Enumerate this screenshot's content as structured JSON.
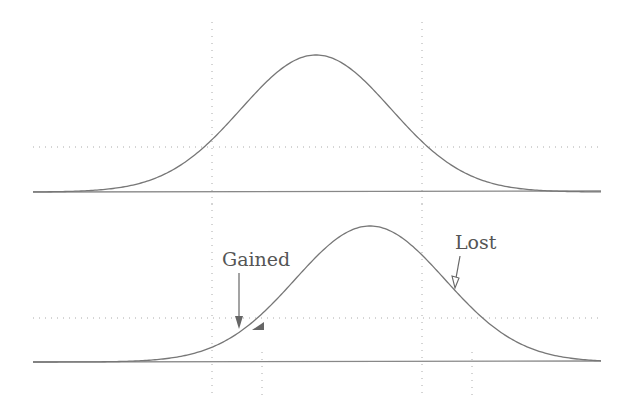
{
  "diagram": {
    "top_panel": {
      "curve_peak_x": 316,
      "curve_peak_y": 55,
      "sigma_px": 75,
      "baseline_y": 192,
      "threshold_y": 147,
      "vertical_markers_x": [
        212,
        422
      ]
    },
    "bottom_panel": {
      "curve_peak_x": 370,
      "curve_peak_y": 226,
      "sigma_px": 75,
      "baseline_y": 362,
      "threshold_y": 318,
      "vertical_markers_x": [
        212,
        422
      ],
      "shifted_markers_x": [
        262,
        472
      ]
    },
    "labels": {
      "gained": "Gained",
      "lost": "Lost"
    },
    "colors": {
      "curve": "#777777",
      "grid": "#999999",
      "text": "#555555"
    }
  }
}
